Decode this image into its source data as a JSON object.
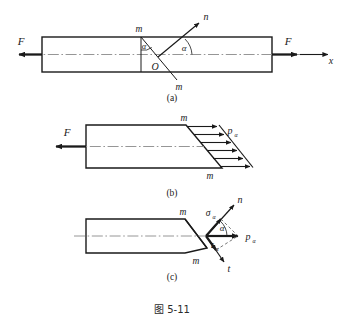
{
  "figure": {
    "caption": "图 5-11",
    "parts": [
      {
        "key": "a",
        "label": "(a)",
        "description": "Prismatic bar in axial tension with inclined section m-m and normal n",
        "labels": {
          "force_left": "F",
          "force_right": "F",
          "axis": "x",
          "normal": "n",
          "section_top": "m",
          "section_bottom": "m",
          "origin": "O",
          "angle_at_section": "α",
          "angle_at_axis": "α"
        }
      },
      {
        "key": "b",
        "label": "(b)",
        "description": "Left portion free body with uniformly distributed stress on inclined section",
        "labels": {
          "force_left": "F",
          "section_top": "m",
          "section_bottom": "m",
          "stress_resultant": "p",
          "stress_resultant_sub": "α"
        },
        "stress_arrow_count": 6
      },
      {
        "key": "c",
        "label": "(c)",
        "description": "Decomposition of total stress into normal and shear components",
        "labels": {
          "section_top": "m",
          "section_bottom": "m",
          "normal_axis": "n",
          "tangent_axis": "t",
          "normal_stress": "σ",
          "normal_stress_sub": "α",
          "shear_stress": "τ",
          "shear_stress_sub": "α",
          "total_stress": "p",
          "total_stress_sub": "α",
          "angle": "α"
        }
      }
    ]
  },
  "style": {
    "line_color": "#1a1a1a",
    "center_line_color": "#7a7a7a",
    "dashed_color": "#555555",
    "background": "#ffffff"
  }
}
